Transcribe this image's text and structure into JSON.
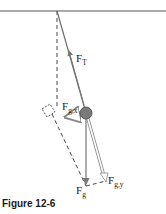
{
  "figure": {
    "caption": "Figure 12-6",
    "labels": {
      "tension": {
        "main": "F",
        "sub": "T"
      },
      "gravity_x": {
        "main": "F",
        "sub": "g,x"
      },
      "gravity_y": {
        "main": "F",
        "sub": "g,y"
      },
      "gravity": {
        "main": "F",
        "sub": "g"
      }
    },
    "colors": {
      "string": "#6e6e6e",
      "bob": "#7a7a7a",
      "dashed": "#333333",
      "ceiling": "#555555",
      "component_arrow": "#9a9a9a"
    }
  }
}
